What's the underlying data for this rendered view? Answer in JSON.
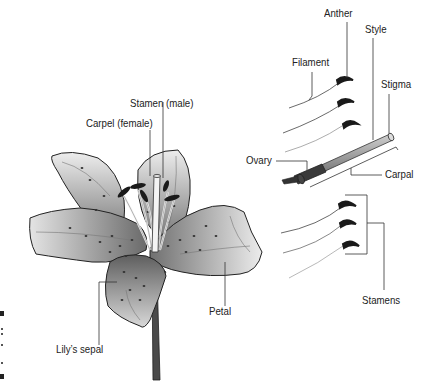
{
  "diagram": {
    "labels": {
      "stamen_male": "Stamen (male)",
      "carpel_female": "Carpel (female)",
      "petal": "Petal",
      "sepal": "Lily’s sepal",
      "anther": "Anther",
      "filament": "Filament",
      "style": "Style",
      "stigma": "Stigma",
      "ovary": "Ovary",
      "carpal": "Carpal",
      "stamens": "Stamens"
    },
    "colors": {
      "line": "#222222",
      "petal_light": "#e6e6e6",
      "petal_dark": "#5a5a5a",
      "anther": "#1a1a1a",
      "stem": "#4a4a4a"
    }
  }
}
